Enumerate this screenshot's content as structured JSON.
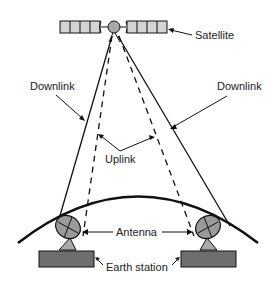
{
  "diagram": {
    "type": "satellite-communication-link",
    "labels": {
      "satellite": "Satellite",
      "downlink_left": "Downlink",
      "downlink_right": "Downlink",
      "uplink": "Uplink",
      "antenna": "Antenna",
      "earth_station": "Earth station"
    },
    "colors": {
      "line": "#111111",
      "panel_fill": "#d4d4d4",
      "body_fill": "#a8a8a8",
      "dish_fill": "#9a9a9a",
      "station_fill": "#6e6e6e",
      "text": "#222222"
    }
  }
}
